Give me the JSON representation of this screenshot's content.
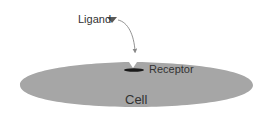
{
  "diagram": {
    "labels": {
      "ligand": "Ligand",
      "receptor": "Receptor",
      "cell": "Cell"
    },
    "colors": {
      "cell_fill": "#a6a6a6",
      "receptor_fill": "#1a1a1a",
      "ligand_fill": "#595959",
      "arrow": "#666666",
      "text": "#333333"
    }
  }
}
